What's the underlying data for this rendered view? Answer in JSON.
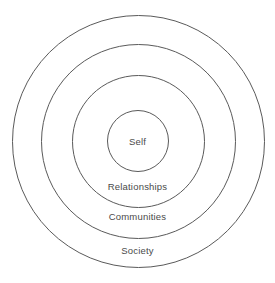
{
  "diagram": {
    "type": "concentric-circles",
    "background_color": "#ffffff",
    "stroke_color": "#5a5a5a",
    "text_color": "#4a4a4a",
    "center": {
      "x": 138,
      "y": 141
    },
    "rings": [
      {
        "id": "society",
        "label": "Society",
        "level": 4,
        "radius": 126,
        "label_center": {
          "x": 138,
          "y": 250
        }
      },
      {
        "id": "communities",
        "label": "Communities",
        "level": 3,
        "radius": 97,
        "label_center": {
          "x": 138,
          "y": 216
        }
      },
      {
        "id": "relationships",
        "label": "Relationships",
        "level": 2,
        "radius": 66,
        "label_center": {
          "x": 138,
          "y": 186
        }
      },
      {
        "id": "self",
        "label": "Self",
        "level": 1,
        "radius": 31,
        "label_center": {
          "x": 138,
          "y": 141
        }
      }
    ]
  }
}
